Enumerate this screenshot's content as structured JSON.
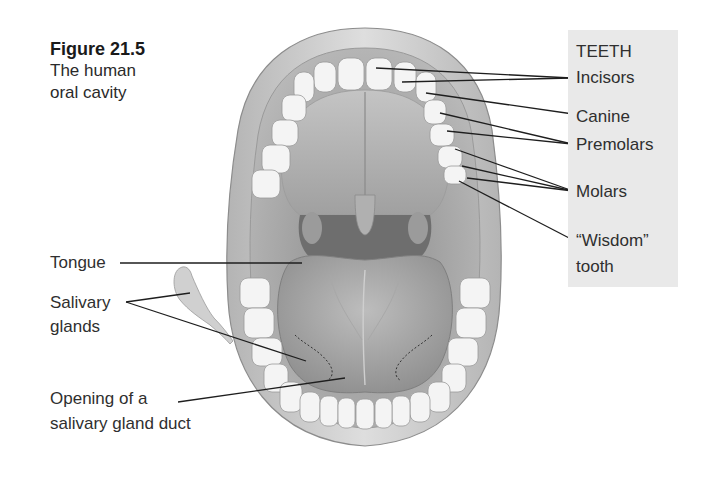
{
  "caption": {
    "figure_number": "Figure 21.5",
    "title_line1": "The human",
    "title_line2": "oral cavity"
  },
  "teeth_panel": {
    "heading": "TEETH",
    "labels": {
      "incisors": "Incisors",
      "canine": "Canine",
      "premolars": "Premolars",
      "molars": "Molars",
      "wisdom_line1": "“Wisdom”",
      "wisdom_line2": "tooth"
    },
    "background_color": "#e9e9e9"
  },
  "left_labels": {
    "tongue": "Tongue",
    "salivary_line1": "Salivary",
    "salivary_line2": "glands",
    "opening_line1": "Opening of a",
    "opening_line2": "salivary gland duct"
  },
  "illustration": {
    "subject": "open human mouth, front view",
    "style": "grayscale pencil shading"
  }
}
